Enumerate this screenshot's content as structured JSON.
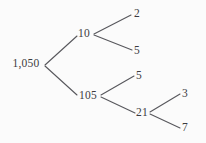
{
  "diagram": {
    "type": "factor-tree",
    "background_color": "#fbfbfb",
    "line_color": "#57575c",
    "text_color": "#3b3b3f",
    "nodes": [
      {
        "id": "root",
        "label": "1,050",
        "x": 26,
        "y": 64,
        "role": "root"
      },
      {
        "id": "n10",
        "label": "10",
        "x": 84,
        "y": 34,
        "role": "branch"
      },
      {
        "id": "n105",
        "label": "105",
        "x": 88,
        "y": 96,
        "role": "branch"
      },
      {
        "id": "leaf2",
        "label": "2",
        "x": 137,
        "y": 14,
        "role": "leaf"
      },
      {
        "id": "leaf5a",
        "label": "5",
        "x": 137,
        "y": 51,
        "role": "leaf"
      },
      {
        "id": "leaf5b",
        "label": "5",
        "x": 139,
        "y": 76,
        "role": "leaf"
      },
      {
        "id": "n21",
        "label": "21",
        "x": 142,
        "y": 113,
        "role": "branch"
      },
      {
        "id": "leaf3",
        "label": "3",
        "x": 185,
        "y": 94,
        "role": "leaf"
      },
      {
        "id": "leaf7",
        "label": "7",
        "x": 185,
        "y": 128,
        "role": "leaf"
      }
    ],
    "edges": [
      {
        "id": "edge-root-10",
        "from": "root",
        "to": "n10",
        "x1": 45,
        "y1": 65,
        "x2": 77,
        "y2": 36
      },
      {
        "id": "edge-root-105",
        "from": "root",
        "to": "n105",
        "x1": 45,
        "y1": 66,
        "x2": 77,
        "y2": 95
      },
      {
        "id": "edge-10-2",
        "from": "n10",
        "to": "leaf2",
        "x1": 94,
        "y1": 34,
        "x2": 131,
        "y2": 15
      },
      {
        "id": "edge-10-5",
        "from": "n10",
        "to": "leaf5a",
        "x1": 94,
        "y1": 35,
        "x2": 132,
        "y2": 50
      },
      {
        "id": "edge-105-5",
        "from": "n105",
        "to": "leaf5b",
        "x1": 101,
        "y1": 95,
        "x2": 134,
        "y2": 76
      },
      {
        "id": "edge-105-21",
        "from": "n105",
        "to": "n21",
        "x1": 101,
        "y1": 97,
        "x2": 135,
        "y2": 113
      },
      {
        "id": "edge-21-3",
        "from": "n21",
        "to": "leaf3",
        "x1": 150,
        "y1": 112,
        "x2": 180,
        "y2": 94
      },
      {
        "id": "edge-21-7",
        "from": "n21",
        "to": "leaf7",
        "x1": 150,
        "y1": 114,
        "x2": 180,
        "y2": 128
      }
    ]
  }
}
